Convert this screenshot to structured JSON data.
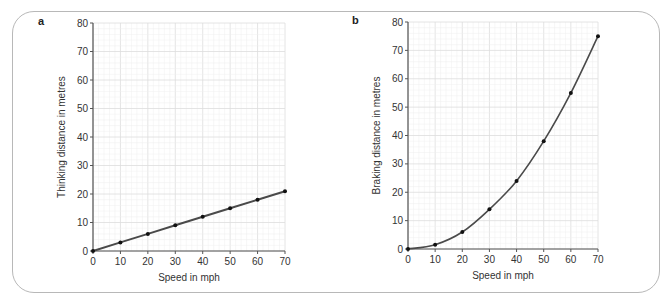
{
  "chart_data": [
    {
      "panel_label": "a",
      "type": "line",
      "title": "",
      "xlabel": "Speed in mph",
      "ylabel": "Thinking distance in metres",
      "x": [
        0,
        10,
        20,
        30,
        40,
        50,
        60,
        70
      ],
      "values": [
        0,
        3,
        6,
        9,
        12,
        15,
        18,
        21
      ],
      "xlim": [
        0,
        70
      ],
      "ylim": [
        0,
        80
      ],
      "xticks": [
        0,
        10,
        20,
        30,
        40,
        50,
        60,
        70
      ],
      "yticks": [
        0,
        10,
        20,
        30,
        40,
        50,
        60,
        70,
        80
      ],
      "grid": true,
      "markers": true,
      "line_color": "#4a4a4a"
    },
    {
      "panel_label": "b",
      "type": "line",
      "title": "",
      "xlabel": "Speed in mph",
      "ylabel": "Braking distance in metres",
      "x": [
        0,
        10,
        20,
        30,
        40,
        50,
        60,
        70
      ],
      "values": [
        0,
        1.5,
        6,
        14,
        24,
        38,
        55,
        75
      ],
      "xlim": [
        0,
        70
      ],
      "ylim": [
        0,
        80
      ],
      "xticks": [
        0,
        10,
        20,
        30,
        40,
        50,
        60,
        70
      ],
      "yticks": [
        0,
        10,
        20,
        30,
        40,
        50,
        60,
        70,
        80
      ],
      "grid": true,
      "markers": true,
      "line_color": "#4a4a4a"
    }
  ],
  "colors": {
    "frame": "#b8b8b8",
    "grid_minor": "#eeeeee",
    "grid_major": "#dddddd",
    "axis": "#555555",
    "line": "#4a4a4a",
    "marker": "#111111"
  }
}
